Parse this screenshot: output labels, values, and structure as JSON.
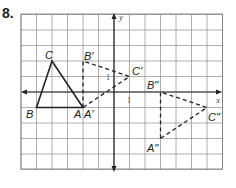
{
  "problem_number": "8.",
  "grid": {
    "x_min": -6,
    "x_max": 7,
    "y_min": -5,
    "y_max": 5,
    "origin_px": [
      114,
      92
    ],
    "cell_px": 15.5
  },
  "axes": {
    "x_label": "x",
    "y_label": "y",
    "x_tick_label": "1",
    "y_tick_label": "1"
  },
  "colors": {
    "grid": "#9a9a9a",
    "axis": "#222222",
    "figure": "#222222"
  },
  "triangles": [
    {
      "name": "ABC",
      "style": "solid",
      "points": [
        {
          "label": "A",
          "x": -2,
          "y": -1
        },
        {
          "label": "B",
          "x": -5,
          "y": -1
        },
        {
          "label": "C",
          "x": -4,
          "y": 2
        }
      ]
    },
    {
      "name": "A'B'C'",
      "style": "dashed",
      "points": [
        {
          "label": "A'",
          "x": -2,
          "y": -1
        },
        {
          "label": "B'",
          "x": -2,
          "y": 2
        },
        {
          "label": "C'",
          "x": 1,
          "y": 1
        }
      ]
    },
    {
      "name": "A''B''C''",
      "style": "dashed",
      "points": [
        {
          "label": "A''",
          "x": 3,
          "y": -3
        },
        {
          "label": "B''",
          "x": 3,
          "y": 0
        },
        {
          "label": "C''",
          "x": 6,
          "y": -1
        }
      ]
    }
  ],
  "labels": {
    "A": "A",
    "B": "B",
    "C": "C",
    "A1": "A'",
    "B1": "B'",
    "C1": "C'",
    "A2": "A\"",
    "B2": "B\"",
    "C2": "C\""
  }
}
